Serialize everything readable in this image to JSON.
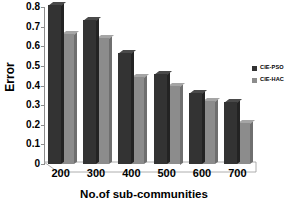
{
  "chart_data": {
    "type": "bar",
    "title": "",
    "xlabel": "No.of sub-communities",
    "ylabel": "Error",
    "categories": [
      "200",
      "300",
      "400",
      "500",
      "600",
      "700"
    ],
    "series": [
      {
        "name": "CIE-PSO",
        "color": "#333333",
        "values": [
          0.81,
          0.735,
          0.565,
          0.46,
          0.36,
          0.315
        ]
      },
      {
        "name": "CIE-HAC",
        "color": "#8c8c8c",
        "values": [
          0.66,
          0.64,
          0.445,
          0.4,
          0.32,
          0.21
        ]
      }
    ],
    "ylim": [
      0,
      0.8
    ],
    "yticks": [
      "0",
      "0.1",
      "0.2",
      "0.3",
      "0.4",
      "0.5",
      "0.6",
      "0.7",
      "0.8"
    ],
    "ytick_values": [
      0,
      0.1,
      0.2,
      0.3,
      0.4,
      0.5,
      0.6,
      0.7,
      0.8
    ],
    "grid": false,
    "legend_position": "right",
    "style": "3d-column"
  }
}
